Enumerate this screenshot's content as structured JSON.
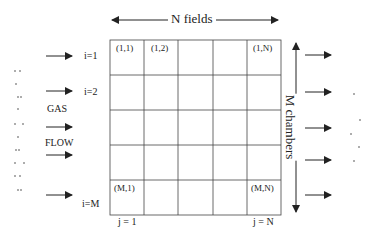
{
  "diagram": {
    "title_top": "N fields",
    "title_right": "M chambers",
    "grid": {
      "rows": 5,
      "cols": 5,
      "left": 110,
      "top": 40,
      "cell_w": 34.2,
      "cell_h": 35
    },
    "cell_labels": {
      "r1c1": "(1,1)",
      "r1c2": "(1,2)",
      "r1cN": "(1,N)",
      "rMc1": "(M,1)",
      "rMcN": "(M,N)"
    },
    "row_labels": {
      "first": "i=1",
      "second": "i=2",
      "last": "i=M"
    },
    "col_labels": {
      "first": "j = 1",
      "last": "j = N"
    },
    "flow_label": {
      "line1": "GAS",
      "line2": "FLOW"
    },
    "inlet_arrows": 5,
    "outlet_arrows": 5,
    "line_color": "#333333"
  }
}
